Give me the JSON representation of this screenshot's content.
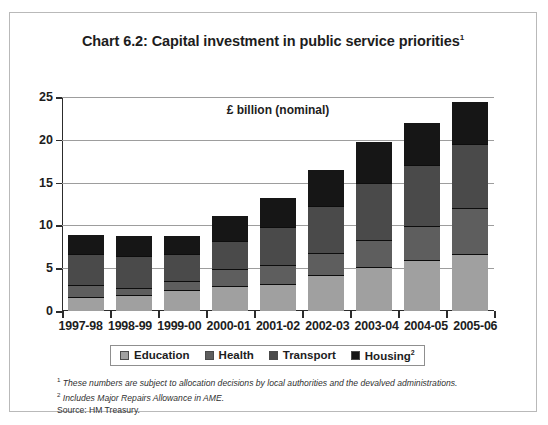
{
  "title": "Chart 6.2: Capital investment in public service priorities",
  "title_footnote_marker": "1",
  "unit_label": "£ billion (nominal)",
  "legend": {
    "items": [
      {
        "label": "Education",
        "color": "#a0a0a0",
        "marker": ""
      },
      {
        "label": "Health",
        "color": "#5e5e5e",
        "marker": ""
      },
      {
        "label": "Transport",
        "color": "#4a4a4a",
        "marker": ""
      },
      {
        "label": "Housing",
        "color": "#161616",
        "marker": "2"
      }
    ]
  },
  "footnotes": [
    {
      "marker": "1",
      "text": "These numbers are subject to allocation decisions by local authorities and the devalved administrations."
    },
    {
      "marker": "2",
      "text": "Includes Major Repairs Allowance in AME."
    }
  ],
  "source": "Source: HM Treasury.",
  "chart_data": {
    "type": "bar",
    "stacked": true,
    "title": "Chart 6.2: Capital investment in public service priorities",
    "xlabel": "",
    "ylabel": "£ billion (nominal)",
    "ylim": [
      0,
      25
    ],
    "yticks": [
      0,
      5,
      10,
      15,
      20,
      25
    ],
    "grid": true,
    "legend_position": "bottom",
    "categories": [
      "1997-98",
      "1998-99",
      "1999-00",
      "2000-01",
      "2001-02",
      "2002-03",
      "2003-04",
      "2004-05",
      "2005-06"
    ],
    "series": [
      {
        "name": "Education",
        "color": "#a0a0a0",
        "values": [
          1.5,
          1.7,
          2.3,
          2.8,
          3.0,
          4.1,
          5.0,
          5.8,
          6.6
        ]
      },
      {
        "name": "Health",
        "color": "#5e5e5e",
        "values": [
          1.3,
          0.8,
          1.0,
          1.9,
          2.2,
          2.4,
          3.1,
          3.9,
          5.2
        ]
      },
      {
        "name": "Transport",
        "color": "#4a4a4a",
        "values": [
          3.5,
          3.6,
          3.0,
          3.1,
          4.3,
          5.4,
          6.5,
          7.0,
          7.4
        ]
      },
      {
        "name": "Housing",
        "color": "#161616",
        "values": [
          2.2,
          2.3,
          2.1,
          3.0,
          3.3,
          4.2,
          4.8,
          4.9,
          4.9
        ]
      }
    ],
    "totals": [
      8.5,
      8.4,
      8.4,
      10.8,
      12.8,
      16.1,
      19.4,
      21.6,
      24.1
    ]
  }
}
